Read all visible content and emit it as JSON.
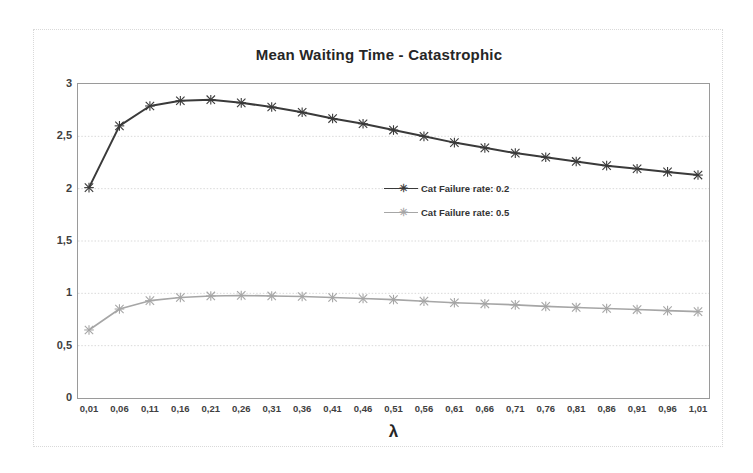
{
  "chart_data": {
    "type": "line",
    "title": "Mean Waiting Time - Catastrophic",
    "xlabel": "λ",
    "ylabel": "",
    "xlim": [
      0.01,
      1.01
    ],
    "ylim": [
      0,
      3
    ],
    "grid": true,
    "legend_position": "center",
    "decimal_separator": ",",
    "x": [
      0.01,
      0.06,
      0.11,
      0.16,
      0.21,
      0.26,
      0.31,
      0.36,
      0.41,
      0.46,
      0.51,
      0.56,
      0.61,
      0.66,
      0.71,
      0.76,
      0.81,
      0.86,
      0.91,
      0.96,
      1.01
    ],
    "xtick_labels": [
      "0,01",
      "0,06",
      "0,11",
      "0,16",
      "0,21",
      "0,26",
      "0,31",
      "0,36",
      "0,41",
      "0,46",
      "0,51",
      "0,56",
      "0,61",
      "0,66",
      "0,71",
      "0,76",
      "0,81",
      "0,86",
      "0,91",
      "0,96",
      "1,01"
    ],
    "ytick_values": [
      0,
      0.5,
      1,
      1.5,
      2,
      2.5,
      3
    ],
    "ytick_labels": [
      "0",
      "0,5",
      "1",
      "1,5",
      "2",
      "2,5",
      "3"
    ],
    "series": [
      {
        "name": "Cat Failure rate: 0.2",
        "color": "#3a3a3a",
        "marker": "x",
        "values": [
          2.01,
          2.6,
          2.79,
          2.84,
          2.85,
          2.82,
          2.78,
          2.73,
          2.67,
          2.62,
          2.56,
          2.5,
          2.44,
          2.39,
          2.34,
          2.3,
          2.26,
          2.22,
          2.19,
          2.16,
          2.13
        ]
      },
      {
        "name": "Cat Failure rate: 0.5",
        "color": "#a6a6a6",
        "marker": "x",
        "values": [
          0.65,
          0.85,
          0.93,
          0.96,
          0.975,
          0.98,
          0.975,
          0.97,
          0.96,
          0.95,
          0.94,
          0.925,
          0.91,
          0.9,
          0.89,
          0.875,
          0.865,
          0.855,
          0.845,
          0.835,
          0.825
        ]
      }
    ]
  },
  "legend": {
    "items": [
      {
        "label": "Cat Failure rate: 0.2"
      },
      {
        "label": "Cat Failure rate: 0.5"
      }
    ]
  }
}
